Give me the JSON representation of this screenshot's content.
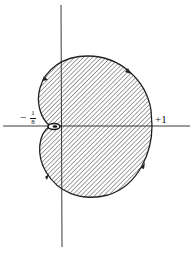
{
  "diagram": {
    "type": "nyquist-plot",
    "labels": {
      "left_minus": "−",
      "left_num": "1",
      "left_den": "8",
      "right": "+1"
    },
    "colors": {
      "stroke": "#222222",
      "hatch": "#333333",
      "background": "#ffffff"
    }
  }
}
